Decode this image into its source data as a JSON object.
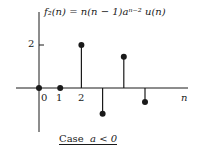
{
  "chart_data": {
    "type": "stem",
    "xlabel": "n",
    "ylabel": "",
    "x": [
      0,
      1,
      2,
      3,
      4,
      5
    ],
    "values": [
      0,
      0,
      2,
      -1.2,
      1.45,
      -0.65
    ],
    "x_tick_labels": [
      "0",
      "1",
      "2"
    ],
    "y_tick_labels": [
      "2"
    ],
    "caption": "Case a < 0",
    "grid": false
  },
  "labels": {
    "title_html": "f₂(n) = n(n − 1)aⁿ⁻² u(n)",
    "xaxis": "n",
    "ytick": "2",
    "xticks": [
      "0",
      "1",
      "2"
    ],
    "caption_prefix": "Case",
    "caption_expr": "a < 0"
  }
}
